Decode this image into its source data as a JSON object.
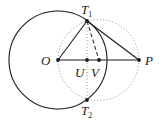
{
  "diagram": {
    "points": {
      "O": {
        "label": "O",
        "x": 58,
        "y": 60
      },
      "U": {
        "label": "U",
        "x": 87,
        "y": 60
      },
      "V": {
        "label": "V",
        "x": 99,
        "y": 60
      },
      "P": {
        "label": "P",
        "x": 139,
        "y": 60
      },
      "T1": {
        "label": "T",
        "sub": "1",
        "x": 87,
        "y": 21
      },
      "T2": {
        "label": "T",
        "sub": "2",
        "x": 87,
        "y": 100
      }
    },
    "circles": [
      {
        "name": "circle-O",
        "cx": 58,
        "cy": 60,
        "r": 49,
        "style": "solid"
      },
      {
        "name": "circle-OP",
        "cx": 98.5,
        "cy": 60,
        "r": 40.5,
        "style": "dotted"
      }
    ],
    "segments": [
      {
        "from": "O",
        "to": "P",
        "style": "solid"
      },
      {
        "from": "O",
        "to": "T1",
        "style": "solid"
      },
      {
        "from": "T1",
        "to": "P",
        "style": "solid"
      },
      {
        "from": "T1",
        "to": "V",
        "style": "dashed"
      },
      {
        "from": "T1",
        "to": "T2",
        "style": "dotted"
      }
    ],
    "colors": {
      "ink": "#1a1a1a",
      "dotted": "#888888"
    }
  }
}
